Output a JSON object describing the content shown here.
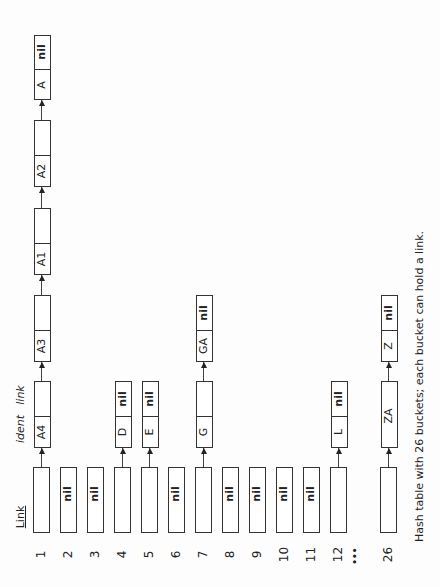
{
  "diagram": {
    "header_labels": {
      "link": "Link",
      "ident": "ident",
      "node_link": "link"
    },
    "nil_text": "nil",
    "ellipsis": "•••",
    "caption": "Hash table with 26 buckets; each bucket can hold a link.",
    "buckets": [
      {
        "index": "1",
        "value": "",
        "chain": [
          "A4",
          "A3",
          "A1",
          "A2",
          "A"
        ]
      },
      {
        "index": "2",
        "value": "nil",
        "chain": []
      },
      {
        "index": "3",
        "value": "nil",
        "chain": []
      },
      {
        "index": "4",
        "value": "",
        "chain": [
          "D"
        ]
      },
      {
        "index": "5",
        "value": "",
        "chain": [
          "E"
        ]
      },
      {
        "index": "6",
        "value": "nil",
        "chain": []
      },
      {
        "index": "7",
        "value": "",
        "chain": [
          "G",
          "GA"
        ]
      },
      {
        "index": "8",
        "value": "nil",
        "chain": []
      },
      {
        "index": "9",
        "value": "nil",
        "chain": []
      },
      {
        "index": "10",
        "value": "nil",
        "chain": []
      },
      {
        "index": "11",
        "value": "nil",
        "chain": []
      },
      {
        "index": "12",
        "value": "",
        "chain": [
          "L"
        ]
      },
      {
        "index": "26",
        "value": "",
        "chain": [
          "ZA",
          "Z"
        ]
      }
    ]
  }
}
